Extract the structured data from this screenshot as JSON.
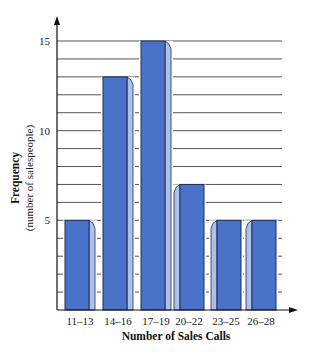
{
  "chart_data": {
    "type": "bar",
    "title": "",
    "xlabel": "Number of Sales Calls",
    "ylabel": "Frequency",
    "ylabel_sub": "(number of salespeople)",
    "categories": [
      "11–13",
      "14–16",
      "17–19",
      "20–22",
      "23–25",
      "26–28"
    ],
    "values": [
      5,
      13,
      15,
      7,
      5,
      5
    ],
    "ylim": [
      0,
      15
    ],
    "yticks": [
      5,
      10,
      15
    ],
    "grid": true,
    "grid_step": 1,
    "legend": null,
    "style": "3d-bars"
  },
  "colors": {
    "bar_front": "#4a72c9",
    "bar_side": "#aebfe8",
    "bar_outline": "#1d2d55",
    "gridline": "#555555",
    "axis": "#111111"
  }
}
